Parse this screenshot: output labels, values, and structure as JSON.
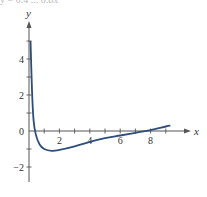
{
  "header": {
    "cropped_text": "y = 0.4 ... 0.8x"
  },
  "chart_data": {
    "type": "line",
    "title": "",
    "xlabel": "x",
    "ylabel": "y",
    "xlim": [
      0,
      10
    ],
    "ylim": [
      -3,
      5.5
    ],
    "grid": false,
    "x_ticks": [
      2,
      4,
      6,
      8
    ],
    "x_minor_ticks": [
      1,
      2,
      3,
      4,
      5,
      6,
      7,
      8,
      9
    ],
    "y_ticks": [
      4,
      2,
      0,
      -2
    ],
    "y_minor_ticks": [
      5,
      4,
      3,
      2,
      1,
      -1,
      -2
    ],
    "origin_label": "0",
    "series": [
      {
        "name": "f(x)",
        "color": "#2e4d7b",
        "x": [
          0.1,
          0.2,
          0.3,
          0.45,
          0.7,
          1.0,
          1.5,
          2,
          3,
          4,
          5,
          6,
          7,
          8,
          9,
          9.3
        ],
        "y": [
          5.0,
          2.2,
          0.6,
          -0.2,
          -0.75,
          -1.0,
          -1.1,
          -1.05,
          -0.85,
          -0.6,
          -0.4,
          -0.25,
          -0.1,
          0.05,
          0.25,
          0.3
        ]
      }
    ],
    "annotations": {
      "x_intercepts": [
        0.4,
        8.0
      ],
      "minimum": [
        1.5,
        -1.1
      ]
    }
  },
  "colors": {
    "axis": "#555555",
    "curve": "#2e4d7b",
    "text": "#333333"
  }
}
